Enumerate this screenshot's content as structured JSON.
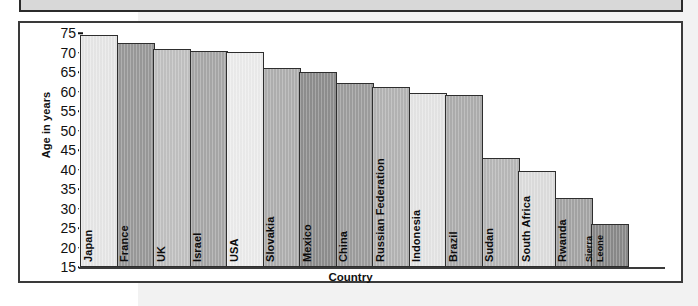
{
  "chart_data": {
    "type": "bar",
    "title": "",
    "subtitle": "",
    "xlabel": "Country",
    "ylabel": "Age in years",
    "ylim": [
      15,
      75
    ],
    "yticks": [
      75,
      70,
      65,
      60,
      55,
      50,
      45,
      40,
      35,
      30,
      25,
      20,
      15
    ],
    "grid": false,
    "legend": false,
    "categories": [
      "Japan",
      "France",
      "UK",
      "Israel",
      "USA",
      "Slovakia",
      "Mexico",
      "China",
      "Russian Federation",
      "Indonesia",
      "Brazil",
      "Sudan",
      "South Africa",
      "Rwanda",
      "Sierra Leone"
    ],
    "values": [
      74.5,
      72.5,
      71.0,
      70.4,
      70.2,
      66.1,
      65.0,
      62.3,
      61.2,
      59.5,
      59.0,
      43.0,
      39.5,
      32.8,
      26.0
    ],
    "bar_colors": [
      "#e8e8e8",
      "#9a9a9a",
      "#c2c2c2",
      "#a8a8a8",
      "#ededed",
      "#b0b0b0",
      "#8f8f8f",
      "#9e9e9e",
      "#b5b5b5",
      "#e6e6e6",
      "#aeaeae",
      "#b9b9b9",
      "#dedede",
      "#a5a5a5",
      "#8a8a8a"
    ]
  },
  "axes": {
    "ylabel": "Age in years",
    "xlabel": "Country"
  },
  "style": {
    "frame_border": "#3a3a3a",
    "bar_border": "#2e2e2e",
    "background": "#ffffff",
    "page_band": "#f2f2f2"
  }
}
